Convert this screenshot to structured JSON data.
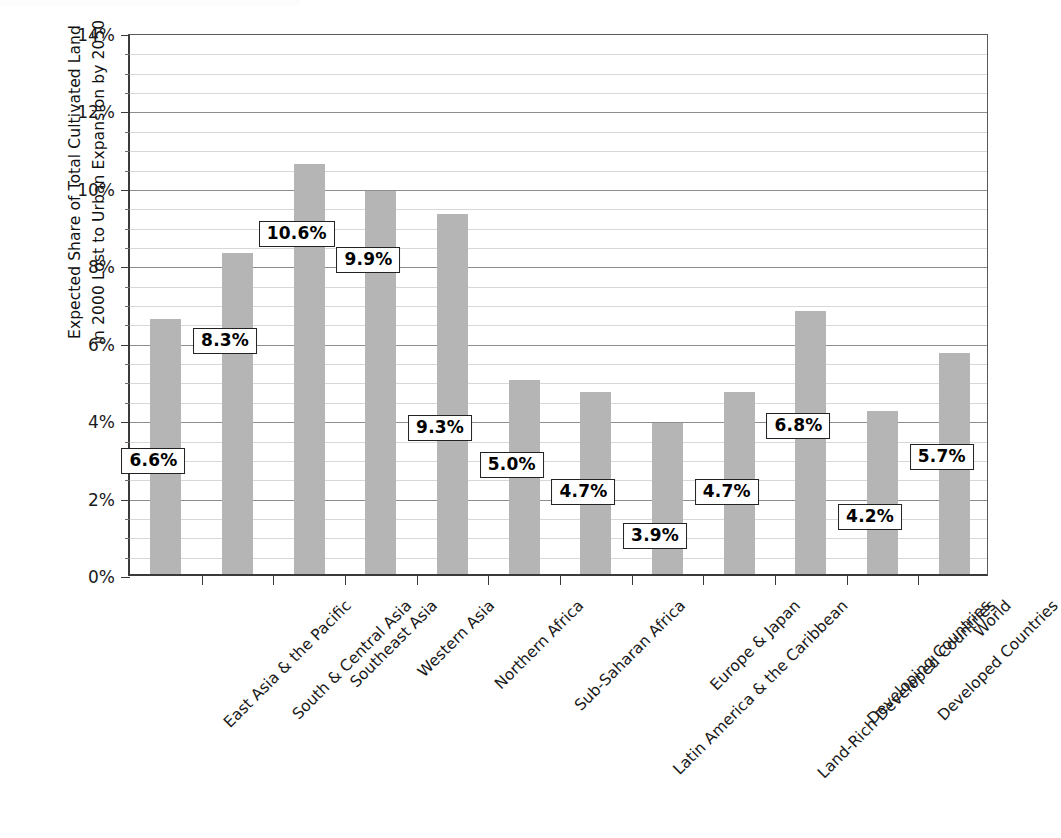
{
  "chart_data": {
    "type": "bar",
    "title": "",
    "xlabel": "",
    "ylabel": "Expected Share of Total Cultivated Land in 2000 Lost to Urban Expansion by 2050",
    "ylabel_lines": [
      "Expected Share of Total Cultivated Land",
      "in 2000 Lost to Urban Expansion by 2050"
    ],
    "ylim": [
      0,
      14
    ],
    "ytick_values": [
      0,
      2,
      4,
      6,
      8,
      10,
      12,
      14
    ],
    "ytick_labels": [
      "0%",
      "2%",
      "4%",
      "6%",
      "8%",
      "10%",
      "12%",
      "14%"
    ],
    "minor_tick_step": 0.5,
    "grid": "horizontal",
    "legend": "none",
    "bar_color": "#b5b5b5",
    "categories": [
      "East Asia & the Pacific",
      "South & Central Asia",
      "Southeast Asia",
      "Western Asia",
      "Northern Africa",
      "Sub-Saharan Africa",
      "Latin America & the Caribbean",
      "Europe & Japan",
      "Land-Rich Developed Countries",
      "Developing Countries",
      "Developed Countries",
      "World"
    ],
    "values": [
      6.6,
      8.3,
      10.6,
      9.9,
      9.3,
      5.0,
      4.7,
      3.9,
      4.7,
      6.8,
      4.2,
      5.7
    ],
    "data_labels": [
      "6.6%",
      "8.3%",
      "10.6%",
      "9.9%",
      "9.3%",
      "5.0%",
      "4.7%",
      "3.9%",
      "4.7%",
      "6.8%",
      "4.2%",
      "5.7%"
    ],
    "data_label_y_values": [
      3.0,
      6.1,
      8.85,
      8.2,
      3.85,
      2.9,
      2.2,
      1.05,
      2.2,
      3.9,
      1.55,
      3.1
    ]
  }
}
